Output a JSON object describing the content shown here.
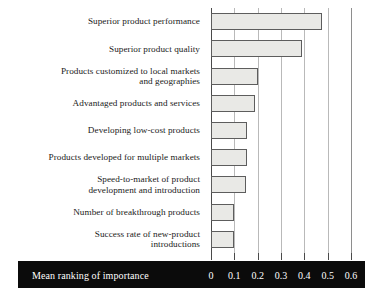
{
  "chart_data": {
    "type": "bar",
    "orientation": "horizontal",
    "title": "",
    "xlabel": "Mean ranking of importance",
    "ylabel": "",
    "xlim": [
      0,
      0.6
    ],
    "xticks": [
      0,
      0.1,
      0.2,
      0.3,
      0.4,
      0.5,
      0.6
    ],
    "xtick_labels": [
      "0",
      "0.1",
      "0.2",
      "0.3",
      "0.4",
      "0.5",
      "0.6"
    ],
    "grid": true,
    "legend": false,
    "bar_fill_color": "#e9e9e6",
    "bar_edge_color": "#5d5d5d",
    "axis_bar_color": "#0b0b0b",
    "axis_bar_text_color": "#ffffff",
    "categories": [
      "Superior product performance",
      "Superior product quality",
      "Products customized to local markets\nand geographies",
      "Advantaged products and services",
      "Developing low-cost products",
      "Products developed for multiple markets",
      "Speed-to-market of product\ndevelopment and introduction",
      "Number of breakthrough products",
      "Success rate of new-product\nintroductions"
    ],
    "values": [
      0.475,
      0.39,
      0.2,
      0.19,
      0.155,
      0.155,
      0.15,
      0.1,
      0.1
    ]
  }
}
